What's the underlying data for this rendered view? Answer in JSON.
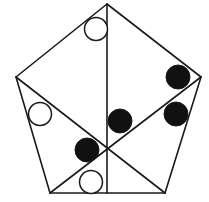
{
  "diagram": {
    "type": "pentagon-puzzle",
    "stroke_color": "#1a1a1a",
    "fill_dark": "#111111",
    "fill_light": "#ffffff",
    "vertices": {
      "top": [
        107,
        4
      ],
      "left": [
        16,
        77
      ],
      "right": [
        201,
        77
      ],
      "bottom_left": [
        50,
        193
      ],
      "bottom_right": [
        165,
        193
      ]
    },
    "lines": [
      {
        "name": "edge-top-left",
        "x1": 107,
        "y1": 4,
        "x2": 16,
        "y2": 77
      },
      {
        "name": "edge-top-right",
        "x1": 107,
        "y1": 4,
        "x2": 201,
        "y2": 77
      },
      {
        "name": "edge-left",
        "x1": 16,
        "y1": 77,
        "x2": 50,
        "y2": 193
      },
      {
        "name": "edge-right",
        "x1": 201,
        "y1": 77,
        "x2": 165,
        "y2": 193
      },
      {
        "name": "edge-bottom",
        "x1": 50,
        "y1": 193,
        "x2": 165,
        "y2": 193
      },
      {
        "name": "vertical-median",
        "x1": 107,
        "y1": 4,
        "x2": 107,
        "y2": 193
      },
      {
        "name": "diagonal-left-to-bottom-right",
        "x1": 16,
        "y1": 77,
        "x2": 165,
        "y2": 193
      },
      {
        "name": "diagonal-right-to-bottom-left",
        "x1": 201,
        "y1": 77,
        "x2": 50,
        "y2": 193
      }
    ],
    "circles": [
      {
        "name": "open-circle-top",
        "cx": 96,
        "cy": 29,
        "r": 11.5,
        "filled": false
      },
      {
        "name": "open-circle-left",
        "cx": 40,
        "cy": 114,
        "r": 11.5,
        "filled": false
      },
      {
        "name": "open-circle-bottom",
        "cx": 91,
        "cy": 182,
        "r": 11.5,
        "filled": false
      },
      {
        "name": "filled-circle-right-upper",
        "cx": 178,
        "cy": 77,
        "r": 12,
        "filled": true
      },
      {
        "name": "filled-circle-right-lower",
        "cx": 176,
        "cy": 114,
        "r": 12,
        "filled": true
      },
      {
        "name": "filled-circle-center",
        "cx": 120,
        "cy": 121,
        "r": 12,
        "filled": true
      },
      {
        "name": "filled-circle-lower-left",
        "cx": 87,
        "cy": 150,
        "r": 12,
        "filled": true
      }
    ]
  }
}
